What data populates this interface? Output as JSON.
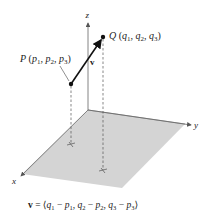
{
  "figure": {
    "axes": {
      "x_label": "x",
      "y_label": "y",
      "z_label": "z"
    },
    "points": {
      "P": {
        "name": "P",
        "coords": "(p1, p2, p3)",
        "c1": "p",
        "s1": "1",
        "c2": "p",
        "s2": "2",
        "c3": "p",
        "s3": "3"
      },
      "Q": {
        "name": "Q",
        "coords": "(q1, q2, q3)",
        "c1": "q",
        "s1": "1",
        "c2": "q",
        "s2": "2",
        "c3": "q",
        "s3": "3"
      }
    },
    "vector_label": "v",
    "caption": {
      "text": "v = ⟨q1 − p1, q2 − p2, q3 − p3⟩",
      "v": "v",
      "eq": " = ⟨",
      "t1a": "q",
      "t1as": "1",
      "m1": " − ",
      "t1b": "p",
      "t1bs": "1",
      "c1": ", ",
      "t2a": "q",
      "t2as": "2",
      "m2": " − ",
      "t2b": "p",
      "t2bs": "2",
      "c2": ", ",
      "t3a": "q",
      "t3as": "3",
      "m3": " − ",
      "t3b": "p",
      "t3bs": "3",
      "close": "⟩"
    },
    "colors": {
      "plane": "#d4d4d4",
      "plane_edge": "#8a8a8a",
      "lines": "#333333"
    }
  }
}
